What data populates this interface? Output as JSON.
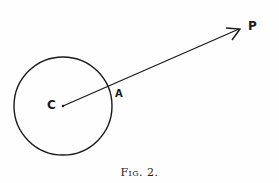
{
  "figure": {
    "caption": "Fig. 2.",
    "colors": {
      "stroke": "#1a1a1a",
      "background": "#fefefe"
    },
    "circle": {
      "center_label": "C",
      "cx": 63,
      "cy": 106,
      "r": 49
    },
    "points": {
      "C": {
        "label": "C",
        "x": 63,
        "y": 106
      },
      "A": {
        "label": "A",
        "x": 110,
        "y": 88
      },
      "P": {
        "label": "P",
        "x": 240,
        "y": 29
      }
    },
    "vector": {
      "from": "C",
      "to": "P",
      "through": "A"
    }
  }
}
